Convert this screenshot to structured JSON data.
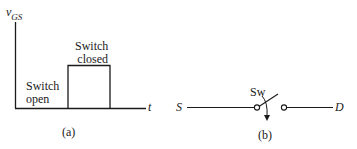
{
  "figure_a": {
    "y_axis_label": "v",
    "y_axis_subscript": "GS",
    "x_axis_label": "t",
    "region_low_label_line1": "Switch",
    "region_low_label_line2": "open",
    "region_high_label_line1": "Switch",
    "region_high_label_line2": "closed",
    "caption": "(a)"
  },
  "figure_b": {
    "source_terminal": "S",
    "drain_terminal": "D",
    "switch_label": "Sw",
    "caption": "(b)"
  },
  "colors": {
    "line": "#1a1a1a",
    "background": "#ffffff"
  }
}
